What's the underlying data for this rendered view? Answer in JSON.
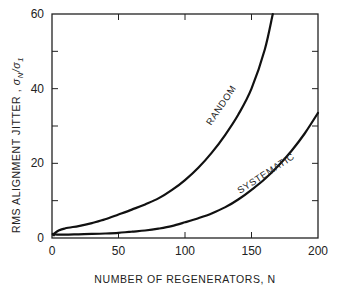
{
  "chart_data": {
    "type": "line",
    "title": "",
    "xlabel": "NUMBER OF REGENERATORS, N",
    "ylabel_main": "RMS ALIGNMENT JITTER , ",
    "ylabel_math": "σN/σ1",
    "xlim": [
      0,
      200
    ],
    "ylim": [
      0,
      60
    ],
    "xticks": [
      0,
      50,
      100,
      150,
      200
    ],
    "xtick_labels": [
      "0",
      "50",
      "100",
      "150",
      "200"
    ],
    "xminor_ticks": [
      50,
      100,
      150
    ],
    "yticks": [
      0,
      20,
      40,
      60
    ],
    "ytick_labels": [
      "0",
      "20",
      "40",
      "60"
    ],
    "yminor_ticks": [
      10,
      30,
      50
    ],
    "grid": false,
    "legend": "none (curves labeled inline)",
    "series": [
      {
        "name": "RANDOM",
        "x": [
          1,
          5,
          10,
          20,
          30,
          40,
          50,
          60,
          70,
          80,
          90,
          100,
          110,
          120,
          130,
          140,
          150,
          160,
          166
        ],
        "values": [
          1.0,
          2.0,
          2.6,
          3.2,
          4.0,
          5.0,
          6.3,
          7.6,
          9.0,
          10.6,
          12.8,
          15.5,
          18.8,
          22.8,
          27.5,
          33.0,
          40.0,
          50.5,
          60.0
        ]
      },
      {
        "name": "SYSTEMATIC",
        "x": [
          1,
          5,
          10,
          20,
          30,
          40,
          50,
          60,
          70,
          80,
          90,
          100,
          110,
          120,
          130,
          140,
          150,
          160,
          170,
          180,
          190,
          200
        ],
        "values": [
          1.0,
          0.9,
          0.9,
          1.0,
          1.1,
          1.2,
          1.4,
          1.7,
          2.0,
          2.5,
          3.2,
          4.2,
          5.3,
          6.6,
          8.2,
          10.3,
          12.9,
          15.8,
          19.3,
          23.3,
          28.0,
          33.5
        ]
      }
    ],
    "annotations": [
      {
        "text": "RANDOM",
        "near_x": 118,
        "near_y": 24,
        "rotated": true
      },
      {
        "text": "SYSTEMATIC",
        "near_x": 168,
        "near_y": 16,
        "rotated": true
      }
    ]
  },
  "labels": {
    "random": "RANDOM",
    "systematic": "SYSTEMATIC"
  }
}
